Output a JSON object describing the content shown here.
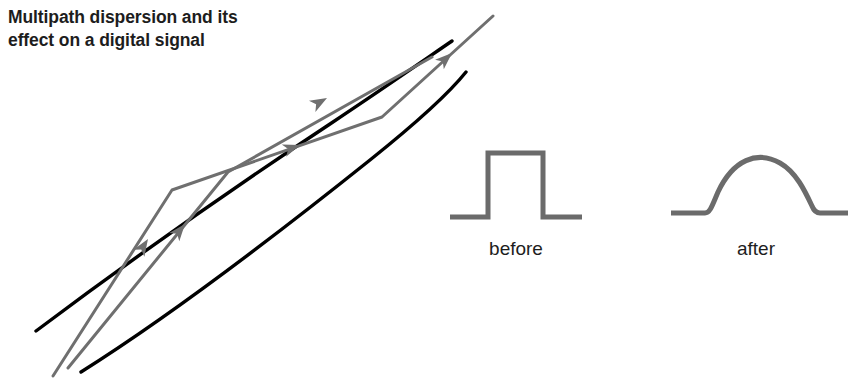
{
  "figure": {
    "width": 864,
    "height": 383,
    "background": "#ffffff",
    "title": "Multipath dispersion and its\neffect on a digital signal",
    "title_color": "#1d1d1d"
  },
  "colors": {
    "waveguide_wall": "#000000",
    "ray": "#6f6f6f",
    "pulse": "#6b6b6b",
    "text": "#1d1d1d"
  },
  "waveguide": {
    "name": "multipath-channel",
    "wall_upper_path": "M 36 331 C 120 268, 230 190, 330 124 C 390 84, 430 56, 452 41",
    "wall_lower_path": "M 81 372 C 170 316, 280 232, 370 160 C 420 120, 450 92, 466 72",
    "stroke_width": 3.4
  },
  "rays": [
    {
      "name": "ray-path-zigzag",
      "description": "Longer multipath ray reflecting off both walls",
      "points": "53,376 172,190 382,117 493,16",
      "stroke_width": 3.0,
      "arrowheads": [
        {
          "x": 148,
          "y": 239,
          "angle": -57.5
        },
        {
          "x": 300,
          "y": 145,
          "angle": -19.2
        },
        {
          "x": 452,
          "y": 53,
          "angle": -42.3
        }
      ]
    },
    {
      "name": "ray-path-direct",
      "description": "Shorter, straighter ray with a single reflection",
      "points": "68,368 228,172 432,57",
      "stroke_width": 3.0,
      "arrowheads": [
        {
          "x": 185,
          "y": 224,
          "angle": -50.8
        },
        {
          "x": 327,
          "y": 98,
          "angle": -29.4
        }
      ]
    }
  ],
  "pulses": [
    {
      "name": "pulse-before",
      "label": "before",
      "shape": "square",
      "path": "M 450 217 L 488 217 L 488 153 L 543 153 L 543 217 L 582 217",
      "stroke_width": 5,
      "label_x": 456,
      "label_y": 238
    },
    {
      "name": "pulse-after",
      "label": "after",
      "shape": "dome",
      "path": "M 671 213 L 705 213 C 710 213, 712 206, 718 192 C 733 160, 757 150, 780 163 C 796 172, 805 191, 812 206 C 814 211, 816 213, 820 213 L 848 213",
      "stroke_width": 5,
      "label_x": 696,
      "label_y": 238
    }
  ]
}
